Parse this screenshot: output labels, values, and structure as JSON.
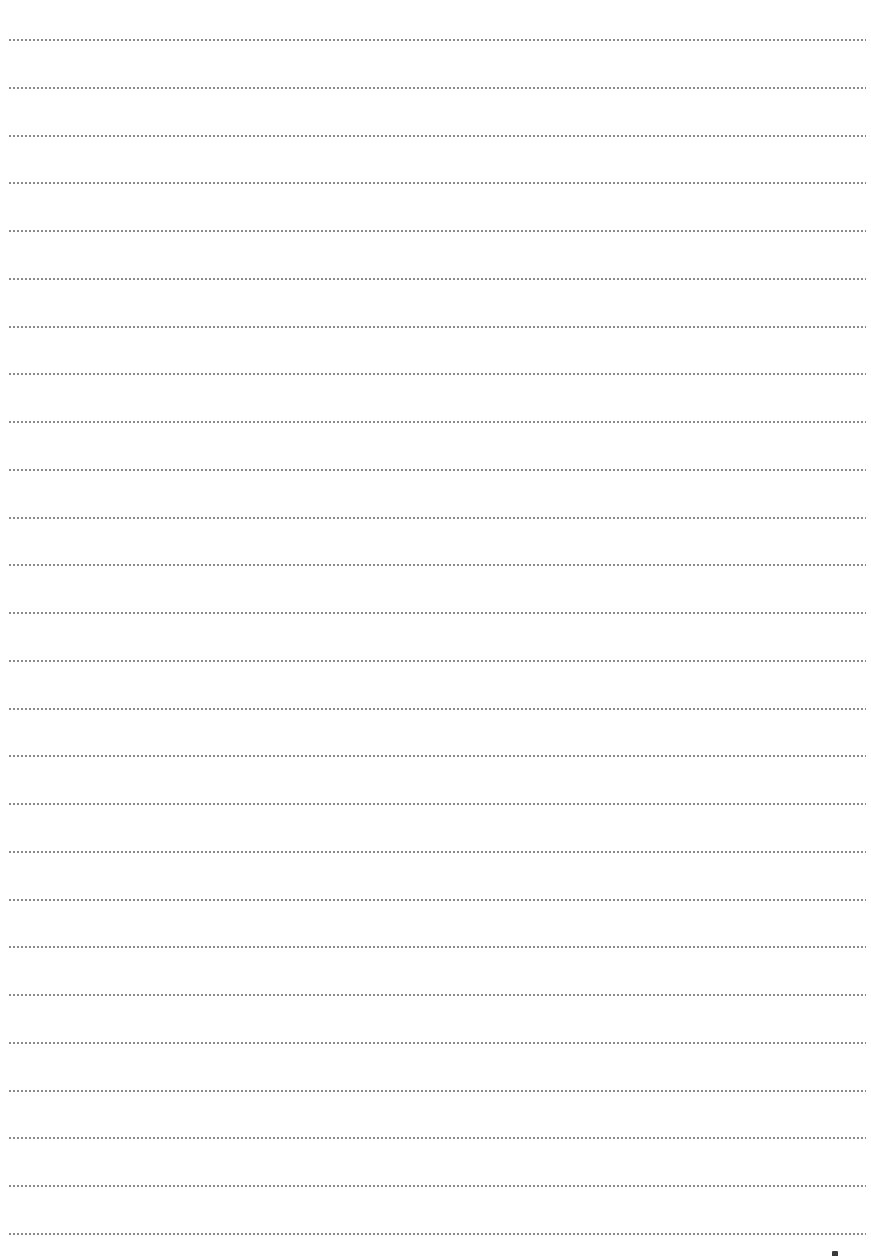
{
  "page": {
    "type": "dotted-ruled-writing-sheet",
    "background_color": "#ffffff",
    "rule_color": "#8a8a8a",
    "rule_count": 26,
    "first_rule_y": 40,
    "rule_spacing": 47.76,
    "rule_left": 8,
    "rule_width": 858,
    "text_content": []
  },
  "corner_mark": {
    "visible": true,
    "color": "#3a3a3a"
  }
}
